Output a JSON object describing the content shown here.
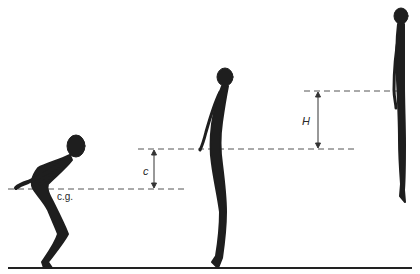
{
  "diagram": {
    "labels": {
      "cg": "c.g.",
      "c": "c",
      "H": "H"
    },
    "figures": [
      {
        "name": "crouched-figure",
        "phase": "crouch"
      },
      {
        "name": "standing-figure",
        "phase": "takeoff"
      },
      {
        "name": "airborne-figure",
        "phase": "peak"
      }
    ],
    "colors": {
      "silhouette": "#1e1e1e",
      "dashed_line": "#555555",
      "ground": "#222222"
    }
  }
}
